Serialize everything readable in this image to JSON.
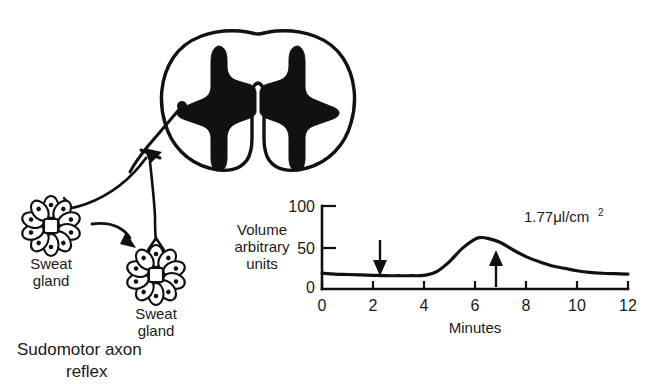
{
  "figure": {
    "title_caption": "Sudomotor axon\nreflex",
    "caption_line1": "Sudomotor axon",
    "caption_line2": "reflex",
    "background_color": "#ffffff",
    "ink_color": "#111111"
  },
  "diagram": {
    "spinal_cord_label": "spinal-cord-cross-section",
    "gland_left": {
      "label_line1": "Sweat",
      "label_line2": "gland",
      "petal_count": 10
    },
    "gland_right": {
      "label_line1": "Sweat",
      "label_line2": "gland",
      "petal_count": 10
    }
  },
  "chart_data": {
    "type": "line",
    "title": "",
    "xlabel": "Minutes",
    "ylabel_lines": [
      "Volume",
      "arbitrary",
      "units"
    ],
    "xlim": [
      0,
      12
    ],
    "ylim": [
      0,
      100
    ],
    "xticks": [
      0,
      2,
      4,
      6,
      8,
      10,
      12
    ],
    "xticklabels": [
      "0",
      "2",
      "4",
      "6",
      "8",
      "10",
      "12"
    ],
    "yticks": [
      0,
      50,
      100
    ],
    "yticklabels": [
      "0",
      "50",
      "100"
    ],
    "grid": false,
    "legend": null,
    "series": [
      {
        "name": "Sweat volume response",
        "x": [
          0,
          0.5,
          1,
          1.5,
          2,
          2.5,
          3,
          3.5,
          4,
          4.5,
          5,
          5.5,
          6,
          6.2,
          6.5,
          7,
          7.5,
          8,
          8.5,
          9,
          9.5,
          10,
          10.5,
          11,
          11.5,
          12
        ],
        "y": [
          19,
          18,
          17.5,
          17,
          16.5,
          16,
          16,
          16,
          16.5,
          21,
          33,
          49,
          60,
          62,
          61,
          56,
          47,
          39,
          33,
          28,
          25,
          22,
          20,
          19,
          18.5,
          18
        ]
      }
    ],
    "annotations": [
      {
        "name": "volume-annotation",
        "text": "1.77μl/cm",
        "superscript": "2",
        "x": 9.0,
        "y": 88
      },
      {
        "name": "stimulus-onset-arrow",
        "direction": "down",
        "x": 2.5,
        "y_from": 57,
        "y_to": 22
      },
      {
        "name": "stimulus-offset-arrow",
        "direction": "up",
        "x": 7.2,
        "y_from": 2,
        "y_to": 45
      }
    ]
  }
}
